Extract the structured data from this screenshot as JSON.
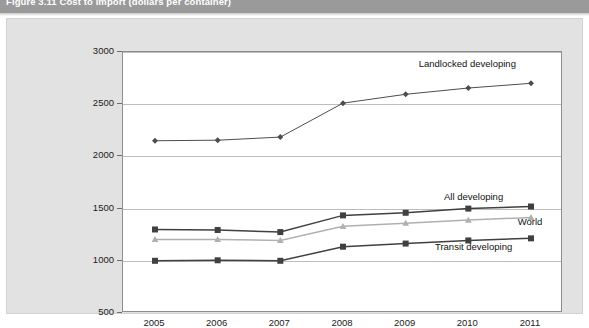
{
  "figure": {
    "title": "Figure 3.11   Cost to import (dollars per container)"
  },
  "chart_data": {
    "type": "line",
    "title": "Cost to import (dollars per container)",
    "xlabel": "",
    "ylabel": "",
    "grid": true,
    "legend_position": "inline-right",
    "categories": [
      "2005",
      "2006",
      "2007",
      "2008",
      "2009",
      "2010",
      "2011"
    ],
    "x": [
      2005,
      2006,
      2007,
      2008,
      2009,
      2010,
      2011
    ],
    "ylim": [
      500,
      3000
    ],
    "yticks": [
      500,
      1000,
      1500,
      2000,
      2500,
      3000
    ],
    "ytick_labels": [
      "500",
      "1000",
      "1500",
      "2000",
      "2500",
      "3000"
    ],
    "series": [
      {
        "name": "Landlocked developing",
        "marker": "diamond",
        "color": "#4d4d4d",
        "values": [
          2150,
          2155,
          2185,
          2510,
          2595,
          2655,
          2700
        ]
      },
      {
        "name": "All developing",
        "marker": "square",
        "color": "#404040",
        "values": [
          1300,
          1295,
          1275,
          1435,
          1460,
          1500,
          1520
        ]
      },
      {
        "name": "World",
        "marker": "triangle",
        "color": "#b0b0b0",
        "values": [
          1205,
          1205,
          1195,
          1330,
          1360,
          1390,
          1415
        ]
      },
      {
        "name": "Transit developing",
        "marker": "square",
        "color": "#404040",
        "values": [
          1000,
          1005,
          1000,
          1135,
          1165,
          1195,
          1215
        ]
      }
    ],
    "annotations": [
      {
        "text": "Landlocked developing",
        "x": 2010.0,
        "y": 2880
      },
      {
        "text": "All developing",
        "x": 2010.1,
        "y": 1605
      },
      {
        "text": "World",
        "x": 2011.0,
        "y": 1360
      },
      {
        "text": "Transit developing",
        "x": 2010.1,
        "y": 1120
      }
    ]
  },
  "colors": {
    "panel_background": "#e2e2e2",
    "plot_background": "#ffffff",
    "gridline": "#bdbdbd",
    "axis": "#8e8e8e",
    "title_band": "#9a9a9a",
    "text": "#1b1b1b"
  }
}
